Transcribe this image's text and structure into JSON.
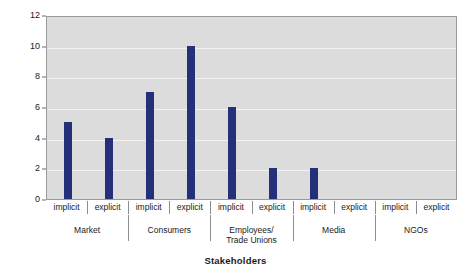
{
  "chart_data": {
    "type": "bar",
    "title": "",
    "subtitle": "",
    "xlabel": "Stakeholders",
    "ylabel": "Frequency",
    "ylim": [
      0,
      12
    ],
    "yticks": [
      0,
      2,
      4,
      6,
      8,
      10,
      12
    ],
    "grid": true,
    "legend": "none",
    "bar_color": "#24307a",
    "plot_background": "#dcdcdc",
    "gridline_color": "#f2f2f2",
    "categories": [
      "implicit",
      "explicit",
      "implicit",
      "explicit",
      "implicit",
      "explicit",
      "implicit",
      "explicit",
      "implicit",
      "explicit"
    ],
    "values": [
      5,
      4,
      7,
      10,
      6,
      2,
      2,
      0,
      0,
      0
    ],
    "groups": [
      {
        "label": "Market",
        "categories": [
          "implicit",
          "explicit"
        ],
        "values": [
          5,
          4
        ]
      },
      {
        "label": "Consumers",
        "categories": [
          "implicit",
          "explicit"
        ],
        "values": [
          7,
          10
        ]
      },
      {
        "label": "Employees/\nTrade Unions",
        "categories": [
          "implicit",
          "explicit"
        ],
        "values": [
          6,
          2
        ]
      },
      {
        "label": "Media",
        "categories": [
          "implicit",
          "explicit"
        ],
        "values": [
          2,
          0
        ]
      },
      {
        "label": "NGOs",
        "categories": [
          "implicit",
          "explicit"
        ],
        "values": [
          0,
          0
        ]
      }
    ]
  }
}
